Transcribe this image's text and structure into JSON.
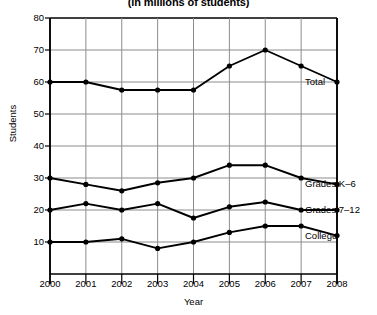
{
  "chart_data": {
    "type": "line",
    "title": "(in millions of students)",
    "xlabel": "Year",
    "ylabel": "Students",
    "categories": [
      "2000",
      "2001",
      "2002",
      "2003",
      "2004",
      "2005",
      "2006",
      "2007",
      "2008"
    ],
    "x": [
      2000,
      2001,
      2002,
      2003,
      2004,
      2005,
      2006,
      2007,
      2008
    ],
    "xlim": [
      2000,
      2008
    ],
    "ylim": [
      0,
      80
    ],
    "yticks": [
      80,
      70,
      60,
      50,
      40,
      30,
      20,
      10
    ],
    "grid": true,
    "legend_position": "inline-right-of-line-end",
    "series": [
      {
        "name": "Total",
        "label": "Total",
        "values": [
          60,
          60,
          57.5,
          57.5,
          57.5,
          65,
          70,
          65,
          60
        ],
        "color": "#000000"
      },
      {
        "name": "Grades K-6",
        "label": "Grades K–6",
        "values": [
          30,
          28,
          26,
          28.5,
          30,
          34,
          34,
          30,
          28
        ],
        "color": "#000000"
      },
      {
        "name": "Grades 7-12",
        "label": "Grades 7–12",
        "values": [
          20,
          22,
          20,
          22,
          17.5,
          21,
          22.5,
          20,
          20
        ],
        "color": "#000000"
      },
      {
        "name": "College",
        "label": "College",
        "values": [
          10,
          10,
          11,
          8,
          10,
          13,
          15,
          15,
          12
        ],
        "color": "#000000"
      }
    ]
  },
  "axes": {
    "y_tick_labels": [
      "80",
      "70",
      "60",
      "50",
      "40",
      "30",
      "20",
      "10"
    ],
    "x_tick_labels": [
      "2000",
      "2001",
      "2002",
      "2003",
      "2004",
      "2005",
      "2006",
      "2007",
      "2008"
    ],
    "y_axis_title": "Students",
    "x_axis_title": "Year"
  },
  "style": {
    "line_color": "#000000",
    "grid_color": "#8c8c8c",
    "axis_color": "#000000",
    "background": "#ffffff"
  }
}
